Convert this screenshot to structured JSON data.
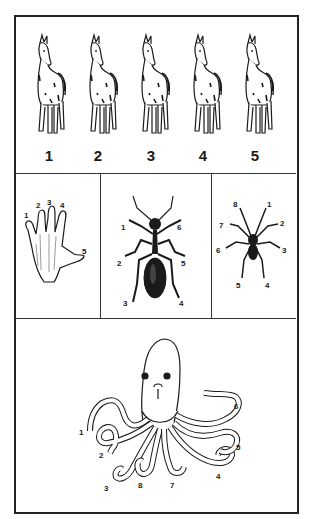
{
  "figure": {
    "panels": {
      "horses": {
        "count": 5,
        "labels": [
          "1",
          "2",
          "3",
          "4",
          "5"
        ]
      },
      "hand": {
        "labels": [
          "1",
          "2",
          "3",
          "4",
          "5"
        ]
      },
      "ant": {
        "labels": [
          "1",
          "2",
          "3",
          "4",
          "5",
          "6"
        ]
      },
      "spider": {
        "labels": [
          "1",
          "2",
          "3",
          "4",
          "5",
          "6",
          "7",
          "8"
        ]
      },
      "octopus": {
        "labels": [
          "1",
          "2",
          "3",
          "4",
          "5",
          "6",
          "7",
          "8"
        ]
      }
    },
    "colors": {
      "ink": "#1a1a1a",
      "background": "#ffffff",
      "border": "#222222"
    }
  }
}
